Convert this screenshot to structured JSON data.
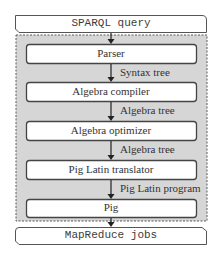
{
  "diagram": {
    "input": {
      "label": "SPARQL query"
    },
    "output": {
      "label": "MapReduce jobs"
    },
    "stages": [
      {
        "label": "Parser"
      },
      {
        "label": "Algebra compiler"
      },
      {
        "label": "Algebra optimizer"
      },
      {
        "label": "Pig Latin translator"
      },
      {
        "label": "Pig"
      }
    ],
    "edges": [
      {
        "label": ""
      },
      {
        "label": "Syntax tree"
      },
      {
        "label": "Algebra tree"
      },
      {
        "label": "Algebra tree"
      },
      {
        "label": "Pig Latin program"
      },
      {
        "label": ""
      }
    ],
    "colors": {
      "container_fill": "#d9d9d9",
      "box_fill": "#ffffff",
      "stroke": "#555555",
      "text": "#333333"
    }
  }
}
